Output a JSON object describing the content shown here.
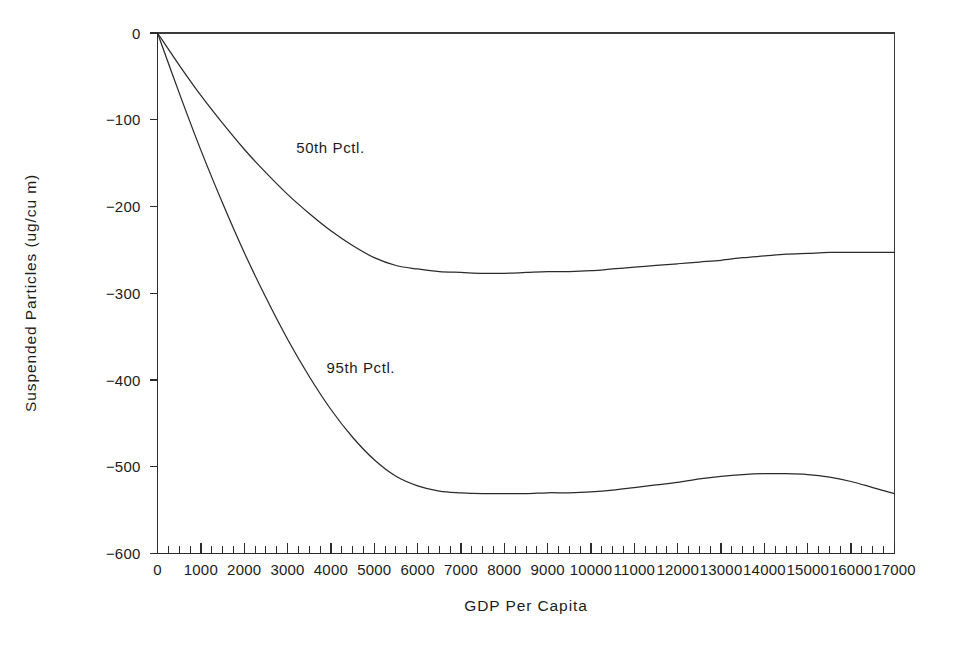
{
  "chart_data": {
    "type": "line",
    "title": "",
    "xlabel": "GDP Per Capita",
    "ylabel": "Suspended Particles (ug/cu m)",
    "xlim": [
      0,
      17000
    ],
    "ylim": [
      -600,
      0
    ],
    "grid": false,
    "legend_position": "inline-annotation",
    "x_ticks": [
      0,
      1000,
      2000,
      3000,
      4000,
      5000,
      6000,
      7000,
      8000,
      9000,
      10000,
      11000,
      12000,
      13000,
      14000,
      15000,
      16000,
      17000
    ],
    "x_tick_labels": [
      "0",
      "1000",
      "2000",
      "3000",
      "4000",
      "5000",
      "6000",
      "7000",
      "8000",
      "9000",
      "10000",
      "11000",
      "12000",
      "13000",
      "14000",
      "15000",
      "16000",
      "17000"
    ],
    "x_minor_tick_interval": 250,
    "y_ticks": [
      0,
      -100,
      -200,
      -300,
      -400,
      -500,
      -600
    ],
    "y_tick_labels": [
      "0",
      "-100",
      "-200",
      "-300",
      "-400",
      "-500",
      "-600"
    ],
    "x": [
      0,
      500,
      1000,
      1500,
      2000,
      2500,
      3000,
      3500,
      4000,
      4500,
      5000,
      5500,
      6000,
      6500,
      7000,
      7500,
      8000,
      8500,
      9000,
      9500,
      10000,
      10500,
      11000,
      11500,
      12000,
      12500,
      13000,
      13500,
      14000,
      14500,
      15000,
      15500,
      16000,
      16500,
      17000
    ],
    "series": [
      {
        "name": "50th Pctl.",
        "label": "50th Pctl.",
        "label_x": 3200,
        "label_y": -138,
        "color": "#2a2a2a",
        "values": [
          0,
          -37,
          -72,
          -104,
          -134,
          -161,
          -186,
          -208,
          -228,
          -245,
          -259,
          -268,
          -272,
          -275,
          -276,
          -277,
          -277,
          -276,
          -275,
          -275,
          -274,
          -272,
          -270,
          -268,
          -266,
          -264,
          -262,
          -259,
          -257,
          -255,
          -254,
          -253,
          -253,
          -253,
          -253
        ]
      },
      {
        "name": "95th Pctl.",
        "label": "95th Pctl.",
        "label_x": 3900,
        "label_y": -392,
        "color": "#2a2a2a",
        "values": [
          0,
          -69,
          -135,
          -196,
          -253,
          -305,
          -353,
          -396,
          -434,
          -466,
          -492,
          -511,
          -522,
          -528,
          -530,
          -531,
          -531,
          -531,
          -530,
          -530,
          -529,
          -527,
          -524,
          -521,
          -518,
          -514,
          -511,
          -509,
          -508,
          -508,
          -509,
          -512,
          -517,
          -524,
          -531
        ]
      }
    ]
  },
  "axis": {
    "x_title": "GDP Per Capita",
    "y_title": "Suspended Particles (ug/cu m)"
  }
}
